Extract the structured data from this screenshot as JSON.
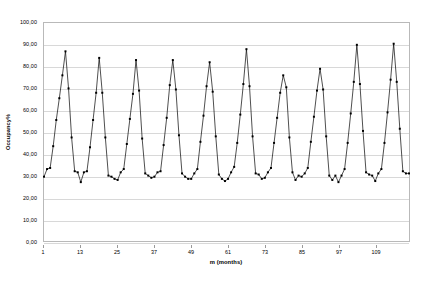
{
  "chart_data": {
    "type": "line",
    "title": "",
    "xlabel": "m (months)",
    "ylabel": "Occupancy%",
    "xlim": [
      1,
      120
    ],
    "ylim": [
      0,
      100
    ],
    "grid": true,
    "legend": false,
    "marker": "square",
    "line_color": "#000000",
    "marker_color": "#000000",
    "ytick_labels": [
      "100,00",
      "90,00",
      "80,00",
      "70,00",
      "60,00",
      "50,00",
      "40,00",
      "30,00",
      "20,00",
      "10,00",
      "0,00"
    ],
    "ytick_values": [
      100,
      90,
      80,
      70,
      60,
      50,
      40,
      30,
      20,
      10,
      0
    ],
    "xtick_labels": [
      "1",
      "13",
      "25",
      "37",
      "49",
      "61",
      "73",
      "85",
      "97",
      "109"
    ],
    "xtick_values": [
      1,
      13,
      25,
      37,
      49,
      61,
      73,
      85,
      97,
      109
    ],
    "x": [
      1,
      2,
      3,
      4,
      5,
      6,
      7,
      8,
      9,
      10,
      11,
      12,
      13,
      14,
      15,
      16,
      17,
      18,
      19,
      20,
      21,
      22,
      23,
      24,
      25,
      26,
      27,
      28,
      29,
      30,
      31,
      32,
      33,
      34,
      35,
      36,
      37,
      38,
      39,
      40,
      41,
      42,
      43,
      44,
      45,
      46,
      47,
      48,
      49,
      50,
      51,
      52,
      53,
      54,
      55,
      56,
      57,
      58,
      59,
      60,
      61,
      62,
      63,
      64,
      65,
      66,
      67,
      68,
      69,
      70,
      71,
      72,
      73,
      74,
      75,
      76,
      77,
      78,
      79,
      80,
      81,
      82,
      83,
      84,
      85,
      86,
      87,
      88,
      89,
      90,
      91,
      92,
      93,
      94,
      95,
      96,
      97,
      98,
      99,
      100,
      101,
      102,
      103,
      104,
      105,
      106,
      107,
      108,
      109,
      110,
      111,
      112,
      113,
      114,
      115,
      116,
      117,
      118,
      119,
      120
    ],
    "values": [
      29.5,
      33.0,
      33.5,
      43.5,
      55.5,
      65.5,
      76.0,
      87.0,
      70.0,
      47.5,
      32.0,
      31.5,
      27.0,
      31.5,
      32.0,
      43.0,
      55.5,
      68.0,
      84.0,
      68.0,
      47.5,
      30.0,
      29.5,
      28.5,
      28.0,
      31.5,
      33.0,
      44.5,
      56.0,
      67.5,
      83.0,
      69.0,
      47.0,
      31.0,
      30.0,
      29.0,
      29.5,
      31.5,
      32.0,
      44.0,
      56.5,
      71.5,
      83.0,
      69.5,
      48.5,
      31.0,
      29.5,
      28.5,
      28.5,
      31.0,
      33.0,
      45.5,
      57.5,
      71.0,
      82.0,
      68.5,
      48.0,
      30.5,
      28.5,
      27.5,
      28.5,
      31.5,
      34.0,
      45.0,
      58.0,
      72.0,
      88.0,
      71.0,
      48.0,
      31.0,
      30.5,
      28.5,
      29.0,
      31.5,
      33.5,
      45.0,
      56.5,
      68.0,
      76.0,
      70.5,
      47.5,
      31.5,
      28.0,
      30.0,
      29.5,
      31.0,
      33.5,
      45.5,
      57.0,
      69.0,
      79.0,
      69.5,
      48.0,
      30.0,
      28.0,
      30.0,
      27.0,
      30.0,
      33.0,
      45.0,
      58.5,
      73.0,
      90.0,
      72.0,
      50.5,
      31.5,
      30.5,
      30.0,
      27.5,
      31.0,
      33.0,
      45.0,
      59.0,
      74.0,
      90.5,
      73.0,
      51.5,
      32.0,
      31.0,
      31.0
    ]
  }
}
